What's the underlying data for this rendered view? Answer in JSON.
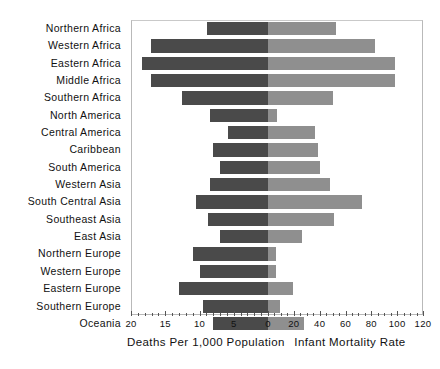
{
  "chart_data": {
    "type": "bar",
    "title": "",
    "subtype": "population-pyramid-style paired horizontal bar chart",
    "orientation": "horizontal",
    "grid": false,
    "legend_position": "none",
    "categories": [
      "Northern Africa",
      "Western Africa",
      "Eastern Africa",
      "Middle Africa",
      "Southern Africa",
      "North America",
      "Central America",
      "Caribbean",
      "South America",
      "Western Asia",
      "South Central Asia",
      "Southeast Asia",
      "East Asia",
      "Northern Europe",
      "Western Europe",
      "Eastern Europe",
      "Southern Europe",
      "Oceania"
    ],
    "series": [
      {
        "name": "Deaths Per 1,000 Population",
        "axis": "left",
        "color": "#4a4a4a",
        "axis_label": "Deaths Per 1,000 Population",
        "axis_range": [
          20,
          0
        ],
        "axis_ticks": [
          20,
          15,
          10,
          5,
          0
        ],
        "values": [
          8.9,
          17.1,
          18.4,
          17.1,
          12.5,
          8.5,
          5.8,
          8.0,
          7.0,
          8.5,
          10.5,
          8.8,
          7.0,
          11.0,
          10.0,
          13.0,
          9.5,
          8.0
        ]
      },
      {
        "name": "Infant Mortality Rate",
        "axis": "right",
        "color": "#8f8f8f",
        "axis_label": "Infant Mortality Rate",
        "axis_range": [
          0,
          120
        ],
        "axis_ticks": [
          0,
          20,
          40,
          60,
          80,
          100,
          120
        ],
        "values": [
          53,
          83,
          98,
          98,
          50,
          7,
          36,
          39,
          40,
          48,
          73,
          51,
          26,
          6,
          6,
          19,
          9,
          28
        ]
      }
    ],
    "tick_labels_left": [
      "20",
      "15",
      "10",
      "5",
      "0"
    ],
    "tick_labels_right": [
      "20",
      "40",
      "60",
      "80",
      "100",
      "120"
    ],
    "xlabel_left": "Deaths Per 1,000 Population",
    "xlabel_right": "Infant Mortality Rate"
  },
  "colors": {
    "left_bar": "#4a4a4a",
    "right_bar": "#8f8f8f",
    "frame": "#b9b9b9",
    "text": "#111111",
    "background": "#ffffff"
  }
}
